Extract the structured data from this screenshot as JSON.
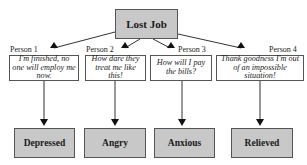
{
  "root": {
    "label": "Lost Job"
  },
  "people": [
    {
      "label": "Person 1",
      "thought": "I'm finished, no one will employ me now.",
      "emotion": "Depressed"
    },
    {
      "label": "Person 2",
      "thought": "How dare they treat me like this!",
      "emotion": "Angry"
    },
    {
      "label": "Person 3",
      "thought": "How will I pay the bills?",
      "emotion": "Anxious"
    },
    {
      "label": "Person 4",
      "thought": "Thank goodness I'm out of an impossible situation!",
      "emotion": "Relieved"
    }
  ],
  "colors": {
    "box_fill": "#c8c8c8",
    "border": "#555555",
    "arrow": "#111111"
  }
}
